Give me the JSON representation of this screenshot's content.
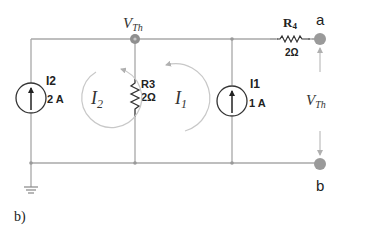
{
  "diagram": {
    "type": "circuit",
    "caption": "b)",
    "node_top": {
      "label_main": "V",
      "label_sub": "Th"
    },
    "terminals": [
      {
        "id": "a",
        "label": "a"
      },
      {
        "id": "b",
        "label": "b"
      }
    ],
    "output_voltage": {
      "label_main": "V",
      "label_sub": "Th"
    },
    "components": {
      "I2": {
        "name": "I2",
        "value": "2 A",
        "type": "current-source",
        "direction": "up"
      },
      "R3": {
        "name": "R3",
        "value": "2Ω",
        "type": "resistor"
      },
      "I1": {
        "name": "I1",
        "value": "1 A",
        "type": "current-source",
        "direction": "up"
      },
      "R4": {
        "name_main": "R",
        "name_sub": "4",
        "value": "2Ω",
        "type": "resistor"
      }
    },
    "mesh_currents": [
      {
        "main": "I",
        "sub": "2",
        "direction": "clockwise"
      },
      {
        "main": "I",
        "sub": "1",
        "direction": "counterclockwise"
      }
    ],
    "ground": "ground-symbol",
    "colors": {
      "wire": "#a8a8a8",
      "node": "#8f8f8f",
      "terminal": "#9a9a9a",
      "component": "#333333",
      "mesh_arrow": "#c8c8c8"
    }
  }
}
